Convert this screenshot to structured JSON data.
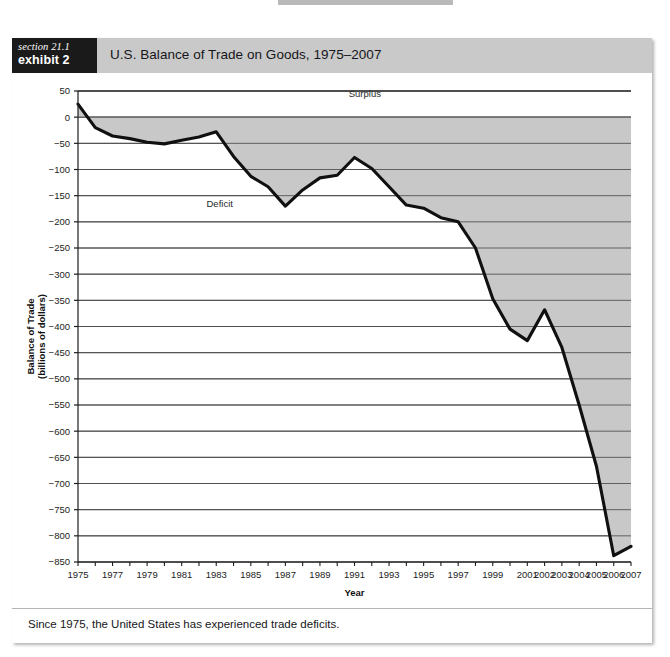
{
  "page_bleed": {
    "line1": "current account since 1975.",
    "line2": ""
  },
  "figure": {
    "section_label": "section 21.1",
    "exhibit_label": "exhibit 2",
    "title": "U.S. Balance of Trade on Goods, 1975–2007",
    "caption": "Since 1975, the United States has experienced trade deficits."
  },
  "colors": {
    "header_bar": "#c9c9c9",
    "section_box": "#1a1a1a",
    "shaded_area": "#c8c8c8",
    "line": "#101010",
    "gridline": "#4f4f4f",
    "axis": "#1d1d1d",
    "page_bg": "#ffffff"
  },
  "chart_data": {
    "type": "area",
    "title": "U.S. Balance of Trade on Goods, 1975–2007",
    "xlabel": "Year",
    "ylabel": "Balance of Trade\n(billions of dollars)",
    "ylabel_line1": "Balance of Trade",
    "ylabel_line2": "(billions of dollars)",
    "xlim": [
      1975,
      2007
    ],
    "ylim": [
      -850,
      50
    ],
    "grid": true,
    "legend": "none",
    "yticks": [
      50,
      0,
      -50,
      -100,
      -150,
      -200,
      -250,
      -300,
      -350,
      -400,
      -450,
      -500,
      -550,
      -600,
      -650,
      -700,
      -750,
      -800,
      -850
    ],
    "ytick_labels": [
      "50",
      "0",
      "−50",
      "−100",
      "−150",
      "−200",
      "−250",
      "−300",
      "−350",
      "−400",
      "−450",
      "−500",
      "−550",
      "−600",
      "−650",
      "−700",
      "−750",
      "−800",
      "−850"
    ],
    "xticks": [
      1975,
      1976,
      1977,
      1978,
      1979,
      1980,
      1981,
      1982,
      1983,
      1984,
      1985,
      1986,
      1987,
      1988,
      1989,
      1990,
      1991,
      1992,
      1993,
      1994,
      1995,
      1996,
      1997,
      1998,
      1999,
      2000,
      2001,
      2002,
      2003,
      2004,
      2005,
      2006,
      2007
    ],
    "xtick_labels": [
      "1975",
      "",
      "1977",
      "",
      "1979",
      "",
      "1981",
      "",
      "1983",
      "",
      "1985",
      "",
      "1987",
      "",
      "1989",
      "",
      "1991",
      "",
      "1993",
      "",
      "1995",
      "",
      "1997",
      "",
      "1999",
      "",
      "2001",
      "2002",
      "2003",
      "2004",
      "2005",
      "2006",
      "2007"
    ],
    "annotations": [
      {
        "text": "Surplus",
        "x": 1991.6,
        "y": 38
      },
      {
        "text": "Deficit",
        "x": 1983.2,
        "y": -172
      }
    ],
    "series": [
      {
        "name": "Balance of Trade on Goods",
        "x": [
          1975,
          1976,
          1977,
          1978,
          1979,
          1980,
          1981,
          1982,
          1983,
          1984,
          1985,
          1986,
          1987,
          1988,
          1989,
          1990,
          1991,
          1992,
          1993,
          1994,
          1995,
          1996,
          1997,
          1998,
          1999,
          2000,
          2001,
          2002,
          2003,
          2004,
          2005,
          2006,
          2007
        ],
        "values": [
          25,
          -20,
          -36,
          -41,
          -48,
          -51,
          -44,
          -38,
          -28,
          -75,
          -113,
          -133,
          -170,
          -139,
          -116,
          -111,
          -77,
          -98,
          -133,
          -168,
          -174,
          -192,
          -200,
          -250,
          -347,
          -405,
          -427,
          -368,
          -440,
          -550,
          -667,
          -838,
          -820
        ]
      }
    ]
  }
}
